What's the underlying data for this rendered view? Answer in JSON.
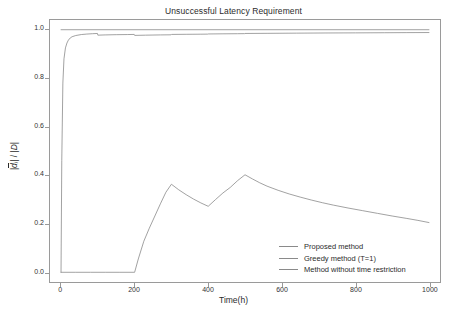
{
  "chart_data": {
    "type": "line",
    "title": "Unsuccessful Latency Requirement",
    "xlabel": "Time(h)",
    "ylabel": "|d̅ᵢ| / |D|",
    "xlim": [
      -30,
      1030
    ],
    "ylim": [
      -0.04,
      1.04
    ],
    "xticks": [
      0,
      200,
      400,
      600,
      800,
      1000
    ],
    "xtick_labels": [
      "0",
      "200",
      "400",
      "600",
      "800",
      "1000"
    ],
    "yticks": [
      0.0,
      0.2,
      0.4,
      0.6,
      0.8,
      1.0
    ],
    "ytick_labels": [
      "0.0",
      "0.2",
      "0.4",
      "0.6",
      "0.8",
      "1.0"
    ],
    "grid": false,
    "legend_position": "lower right",
    "series": [
      {
        "name": "Proposed method",
        "color": "#8a8a8a",
        "x": [
          0,
          2,
          5,
          8,
          12,
          16,
          20,
          25,
          30,
          40,
          55,
          70,
          85,
          99,
          100,
          120,
          150,
          180,
          199,
          200,
          230,
          270,
          299,
          300,
          340,
          380,
          399,
          400,
          440,
          480,
          499,
          500,
          560,
          640,
          720,
          800,
          880,
          940,
          1000
        ],
        "y": [
          0.0,
          0.46,
          0.78,
          0.88,
          0.925,
          0.945,
          0.957,
          0.966,
          0.971,
          0.976,
          0.98,
          0.982,
          0.9835,
          0.9845,
          0.9775,
          0.9785,
          0.9795,
          0.98,
          0.9805,
          0.9765,
          0.9775,
          0.9785,
          0.979,
          0.9805,
          0.981,
          0.9815,
          0.9818,
          0.9825,
          0.983,
          0.9835,
          0.9838,
          0.9845,
          0.985,
          0.9858,
          0.9865,
          0.987,
          0.9875,
          0.988,
          0.9883
        ]
      },
      {
        "name": "Greedy method (T=1)",
        "color": "#8a8a8a",
        "x": [
          0,
          40,
          80,
          120,
          160,
          200,
          210,
          225,
          240,
          255,
          270,
          285,
          300,
          320,
          340,
          360,
          380,
          400,
          420,
          440,
          460,
          480,
          500,
          520,
          540,
          560,
          590,
          620,
          650,
          680,
          710,
          740,
          780,
          820,
          860,
          900,
          940,
          970,
          1000
        ],
        "y": [
          0.0,
          0.0,
          0.0,
          0.0,
          0.0,
          0.0,
          0.055,
          0.128,
          0.182,
          0.232,
          0.282,
          0.33,
          0.363,
          0.34,
          0.32,
          0.302,
          0.286,
          0.272,
          0.3,
          0.327,
          0.35,
          0.378,
          0.402,
          0.385,
          0.369,
          0.355,
          0.338,
          0.323,
          0.31,
          0.298,
          0.287,
          0.277,
          0.265,
          0.254,
          0.243,
          0.232,
          0.222,
          0.214,
          0.205
        ]
      },
      {
        "name": "Method without time restriction",
        "color": "#8a8a8a",
        "x": [
          0,
          1000
        ],
        "y": [
          1.0,
          1.0
        ]
      }
    ]
  },
  "legend": {
    "items": [
      {
        "label": "Proposed method"
      },
      {
        "label": "Greedy method (T=1)"
      },
      {
        "label": "Method without time restriction"
      }
    ]
  },
  "style": {
    "axis_color": "#9a9a9a",
    "text_color": "#2b2b2b",
    "line_color": "#8a8a8a",
    "background": "#ffffff"
  }
}
